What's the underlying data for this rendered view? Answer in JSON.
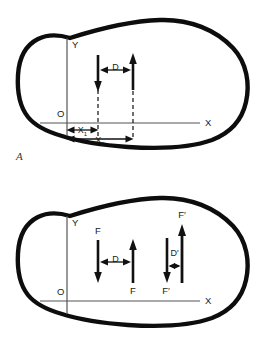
{
  "figure": {
    "type": "mechanics-diagram",
    "panels": [
      {
        "id": "A",
        "caption": "A",
        "axes": {
          "origin_label": "O",
          "y_label": "Y",
          "x_label": "X"
        },
        "labels": {
          "distance": "D",
          "x1": "X",
          "x1_sub": "1",
          "x2": "X",
          "x2_sub": "2"
        },
        "forces": [
          {
            "name": "left-force",
            "direction": "down",
            "label": ""
          },
          {
            "name": "right-force",
            "direction": "up",
            "label": ""
          }
        ]
      },
      {
        "id": "B",
        "caption": "B",
        "axes": {
          "origin_label": "O",
          "y_label": "Y",
          "x_label": "X"
        },
        "labels": {
          "distance_left": "D",
          "distance_right": "D",
          "distance_right_prime": "′"
        },
        "forces": [
          {
            "name": "left-pair-down-force",
            "direction": "down",
            "label": "F"
          },
          {
            "name": "left-pair-up-force",
            "direction": "up",
            "label": "F"
          },
          {
            "name": "right-pair-up-force",
            "direction": "up",
            "label": "F′"
          },
          {
            "name": "right-pair-down-force",
            "direction": "down",
            "label": "F′"
          }
        ]
      }
    ],
    "colors": {
      "outline": "#0d0d0d",
      "axis": "#555555",
      "arrow": "#111111",
      "text": "#1a1a1a",
      "caption": "#3a3a3a",
      "background": "#ffffff"
    }
  }
}
